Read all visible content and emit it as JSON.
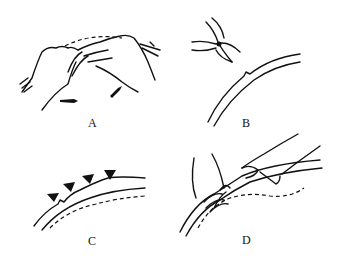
{
  "figure": {
    "panels": [
      {
        "id": "A",
        "label": "A",
        "description": "two hands bending/shaping a rod, dashed arc above, motion arrows below"
      },
      {
        "id": "B",
        "label": "B",
        "description": "pliers/nippers cutting a notch in a curved double-line strip"
      },
      {
        "id": "C",
        "label": "C",
        "description": "curved strip with triangular markers/notches along outer edge, dashed line beneath"
      },
      {
        "id": "D",
        "label": "D",
        "description": "hands wrapping/twisting wire around a curved rod, dashed guide line"
      }
    ],
    "colors": {
      "ink": "#111111",
      "background": "#ffffff"
    }
  }
}
